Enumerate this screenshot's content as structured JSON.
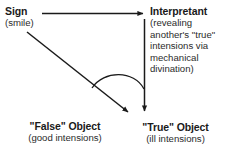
{
  "diagram": {
    "background_color": "#ffffff",
    "line_color": "#1a1a1a",
    "text_color": "#1a1a1a"
  },
  "nodes": {
    "sign": {
      "label": "Sign",
      "sublabel": "(smile)"
    },
    "interpretant": {
      "label": "Interpretant",
      "sublines": [
        "(revealing",
        "another's \"true\"",
        "intensions via",
        "mechanical",
        "divination)"
      ]
    },
    "false_object": {
      "label": "\"False\" Object",
      "sublabel": "(good intensions)"
    },
    "true_object": {
      "label": "\"True\" Object",
      "sublabel": "(ill intensions)"
    }
  },
  "connectors": [
    {
      "name": "sign-to-interpretant",
      "from": "sign",
      "to": "interpretant",
      "style": "straight-arrow",
      "direction": "right"
    },
    {
      "name": "sign-to-false-object",
      "from": "sign",
      "to": "false_object",
      "style": "straight-arrow",
      "direction": "diagonal-down-right"
    },
    {
      "name": "interpretant-to-true-object",
      "from": "interpretant",
      "to": "true_object",
      "style": "straight-arrow",
      "direction": "down"
    },
    {
      "name": "angle-arc",
      "from": "sign-to-false-object",
      "to": "interpretant-to-true-object",
      "style": "arc",
      "direction": "none"
    }
  ]
}
